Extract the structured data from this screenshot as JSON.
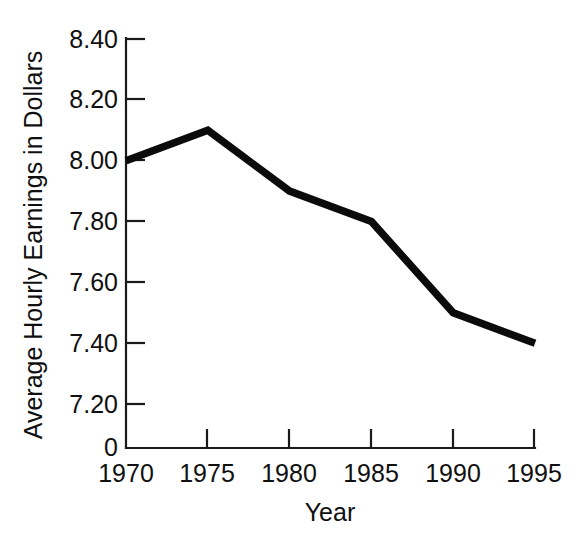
{
  "chart_data": {
    "type": "line",
    "title": "",
    "xlabel": "Year",
    "ylabel": "Average Hourly Earnings in Dollars",
    "categories": [
      1970,
      1975,
      1980,
      1985,
      1990,
      1995
    ],
    "x": [
      1970,
      1975,
      1980,
      1985,
      1990,
      1995
    ],
    "values": [
      8.0,
      8.1,
      7.9,
      7.8,
      7.5,
      7.4
    ],
    "series": [
      {
        "name": "Average Hourly Earnings",
        "values": [
          8.0,
          8.1,
          7.9,
          7.8,
          7.5,
          7.4
        ]
      }
    ],
    "x_tick_labels": [
      "1970",
      "1975",
      "1980",
      "1985",
      "1990",
      "1995"
    ],
    "y_tick_labels": [
      "8.40",
      "8.20",
      "8.00",
      "7.80",
      "7.60",
      "7.40",
      "7.20"
    ],
    "y_tick_values": [
      8.4,
      8.2,
      8.0,
      7.8,
      7.6,
      7.4,
      7.2
    ],
    "origin_label": "0",
    "ylim": [
      7.2,
      8.4
    ],
    "xlim": [
      1970,
      1995
    ],
    "axis_break": true,
    "grid": false,
    "legend": false,
    "legend_position": "none",
    "line_color": "#0b0b0b",
    "axis_color": "#1a1a1a",
    "background_color": "#ffffff"
  },
  "axes": {
    "y_ticks": [
      {
        "label": "8.40",
        "value": 8.4
      },
      {
        "label": "8.20",
        "value": 8.2
      },
      {
        "label": "8.00",
        "value": 8.0
      },
      {
        "label": "7.80",
        "value": 7.8
      },
      {
        "label": "7.60",
        "value": 7.6
      },
      {
        "label": "7.40",
        "value": 7.4
      },
      {
        "label": "7.20",
        "value": 7.2
      }
    ],
    "x_ticks": [
      {
        "label": "1970",
        "value": 1970
      },
      {
        "label": "1975",
        "value": 1975
      },
      {
        "label": "1980",
        "value": 1980
      },
      {
        "label": "1985",
        "value": 1985
      },
      {
        "label": "1990",
        "value": 1990
      },
      {
        "label": "1995",
        "value": 1995
      }
    ],
    "origin_label": "0",
    "x_axis_title": "Year",
    "y_axis_title": "Average Hourly Earnings in Dollars"
  }
}
